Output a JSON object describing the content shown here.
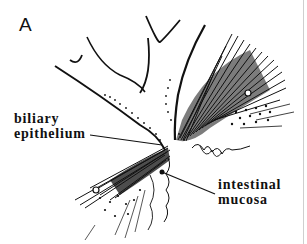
{
  "figure": {
    "panel_letter": "A",
    "labels": {
      "biliary_line1": "biliary",
      "biliary_line2": "epithelium",
      "intestinal_line1": "intestinal",
      "intestinal_line2": "mucosa"
    },
    "colors": {
      "ink": "#111111",
      "background": "#ffffff",
      "border": "#cfcfcf"
    }
  }
}
